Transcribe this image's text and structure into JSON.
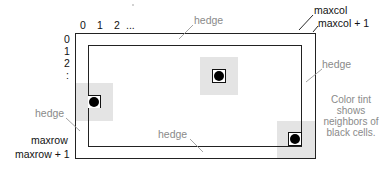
{
  "diagram": {
    "column_labels": [
      "0",
      "1",
      "2",
      "..."
    ],
    "row_labels": [
      "0",
      "1",
      "2",
      ":"
    ],
    "labels": {
      "maxcol": "maxcol",
      "maxcol_plus_1": "maxcol + 1",
      "maxrow": "maxrow",
      "maxrow_plus_1": "maxrow + 1"
    },
    "hedge_labels": {
      "top": "hedge",
      "right": "hedge",
      "left": "hedge",
      "bottom": "hedge"
    },
    "note": {
      "line1": "Color tint",
      "line2": "shows",
      "line3": "neighbors of",
      "line4": "black cells."
    },
    "colors": {
      "border": "#222222",
      "tint": "#e4e4e4",
      "hedge_text": "#8a8a8a",
      "cell": "#000000"
    }
  }
}
